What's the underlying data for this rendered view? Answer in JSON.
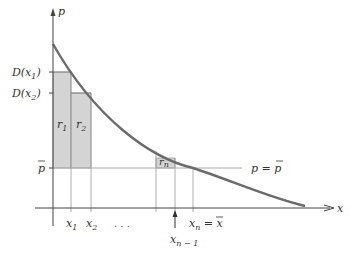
{
  "diagram": {
    "axes": {
      "y_label": "p",
      "x_label": "x"
    },
    "y_ticks": {
      "d_x1": {
        "main": "D(x",
        "sub": "1",
        "close": ")"
      },
      "d_x2": {
        "main": "D(x",
        "sub": "2",
        "close": ")"
      },
      "p_bar": "p"
    },
    "x_ticks": {
      "x1": {
        "main": "x",
        "sub": "1"
      },
      "x2": {
        "main": "x",
        "sub": "2"
      },
      "ellipsis": ". . .",
      "xn_minus_1": {
        "main": "x",
        "sub": "n − 1"
      },
      "xn": {
        "main": "x",
        "sub": "n",
        "eq": " = ",
        "bar": "x"
      }
    },
    "rectangles": {
      "r1": {
        "main": "r",
        "sub": "1"
      },
      "r2": {
        "main": "r",
        "sub": "2"
      },
      "rn": {
        "main": "r",
        "sub": "n"
      }
    },
    "price_line_label": {
      "lhs": "p",
      "eq": " = ",
      "rhs": "p"
    },
    "colors": {
      "curve": "#6b6b6b",
      "rect_fill": "#d4d4d4",
      "axis": "#444444",
      "guide": "#aaaaaa"
    }
  }
}
